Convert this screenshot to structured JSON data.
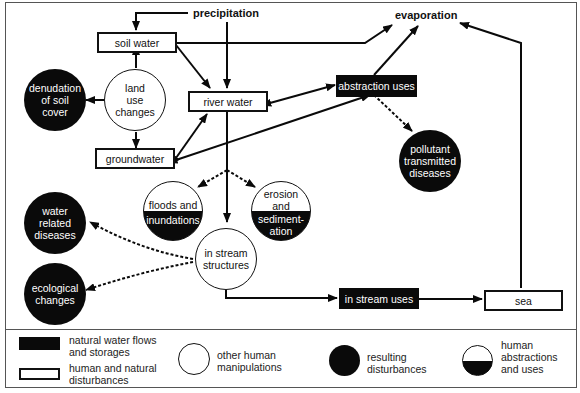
{
  "diagram": {
    "labels": {
      "precipitation": "precipitation",
      "evaporation": "evaporation"
    },
    "natural_flows": {
      "soil_water": "soil water",
      "river_water": "river water",
      "groundwater": "groundwater",
      "sea": "sea"
    },
    "human_uses": {
      "abstraction_uses": "abstraction uses",
      "in_stream_uses": "in stream uses"
    },
    "manipulations": {
      "land_use_changes": [
        "land",
        "use",
        "changes"
      ],
      "in_stream_structures": [
        "in stream",
        "structures"
      ]
    },
    "disturbances": {
      "denudation": [
        "denudation",
        "of soil",
        "cover"
      ],
      "pollutant": [
        "pollutant",
        "transmitted",
        "diseases"
      ],
      "water_related": [
        "water",
        "related",
        "diseases"
      ],
      "ecological": [
        "ecological",
        "changes"
      ]
    },
    "half_nodes": {
      "floods": [
        "floods and",
        "inundations"
      ],
      "erosion": [
        "erosion",
        "and",
        "sediment-",
        "ation"
      ]
    }
  },
  "legend": {
    "black_rect": [
      "natural water flows",
      "and storages"
    ],
    "white_rect": [
      "human and natural",
      "disturbances"
    ],
    "white_circle": [
      "other human",
      "manipulations"
    ],
    "black_circle": [
      "resulting",
      "disturbances"
    ],
    "half_circle": [
      "human",
      "abstractions",
      "and uses"
    ]
  },
  "colors": {
    "ink": "#0a0a0a",
    "paper": "#ffffff",
    "frame": "#555555"
  }
}
